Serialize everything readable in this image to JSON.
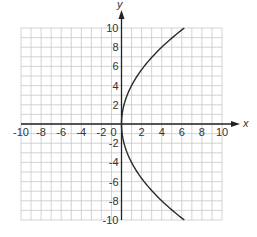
{
  "chart_data": {
    "type": "line",
    "title": "",
    "xlabel": "x",
    "ylabel": "y",
    "xlim": [
      -10,
      10
    ],
    "ylim": [
      -10,
      10
    ],
    "grid": true,
    "grid_step": 1,
    "x_ticks": [
      -10,
      -8,
      -6,
      -4,
      -2,
      0,
      2,
      4,
      6,
      8,
      10
    ],
    "y_ticks": [
      -10,
      -8,
      -6,
      -4,
      -2,
      2,
      4,
      6,
      8,
      10
    ],
    "x_tick_labels": [
      "-10",
      "-8",
      "-6",
      "-4",
      "-2",
      "0",
      "2",
      "4",
      "6",
      "8",
      "10"
    ],
    "y_tick_labels": [
      "-10",
      "-8",
      "-6",
      "-4",
      "-2",
      "2",
      "4",
      "6",
      "8",
      "10"
    ],
    "series": [
      {
        "name": "parabola",
        "equation": "y^2 = 16x",
        "x": [
          6.25,
          4,
          2.25,
          1,
          0.25,
          0,
          0.25,
          1,
          2.25,
          4,
          6.25
        ],
        "y": [
          -10,
          -8,
          -6,
          -4,
          -2,
          0,
          2,
          4,
          6,
          8,
          10
        ]
      }
    ],
    "legend": null
  },
  "colors": {
    "axis": "#222222",
    "grid": "#c8c8c8",
    "curve": "#2a2a2a",
    "text": "#333333"
  }
}
